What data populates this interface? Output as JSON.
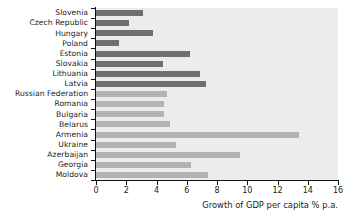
{
  "chart_data": {
    "type": "bar",
    "orientation": "horizontal",
    "title": "",
    "xlabel": "Growth of GDP per capita % p.a.",
    "ylabel": "",
    "xlim": [
      0,
      16
    ],
    "xticks": [
      0,
      2,
      4,
      6,
      8,
      10,
      12,
      14,
      16
    ],
    "xticklabels": [
      "0",
      "2",
      "4",
      "6",
      "8",
      "10",
      "12",
      "14",
      "16"
    ],
    "grid": false,
    "legend": "none",
    "plot_background": "#ececec",
    "group_colors": {
      "dark": "#6f6f6f",
      "light": "#b3b3b3"
    },
    "categories": [
      "Slovenia",
      "Czech Republic",
      "Hungary",
      "Poland",
      "Estonia",
      "Slovakia",
      "Lithuania",
      "Latvia",
      "Russian Federation",
      "Romania",
      "Bulgaria",
      "Belarus",
      "Armenia",
      "Ukraine",
      "Azerbaijan",
      "Georgia",
      "Moldova"
    ],
    "values": [
      3.1,
      2.2,
      3.8,
      1.5,
      6.2,
      4.4,
      6.9,
      7.3,
      4.7,
      4.5,
      4.5,
      4.9,
      13.4,
      5.3,
      9.5,
      6.3,
      7.4
    ],
    "groups": [
      "dark",
      "dark",
      "dark",
      "dark",
      "dark",
      "dark",
      "dark",
      "dark",
      "light",
      "light",
      "light",
      "light",
      "light",
      "light",
      "light",
      "light",
      "light"
    ]
  }
}
